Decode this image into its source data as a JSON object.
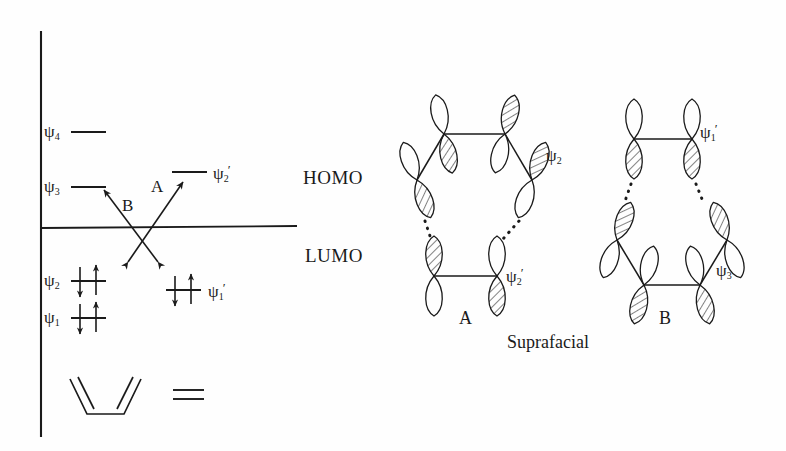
{
  "figure": {
    "caption_bottom": "Suprafacial",
    "ink_color": "#1a1a1a",
    "background_color": "#fefefe"
  },
  "energy_diagram": {
    "axis": {
      "vertical_label": "",
      "zero_line_label": ""
    },
    "diene_levels": [
      {
        "id": "psi4",
        "symbol": "ψ",
        "sub": "4",
        "prime": "",
        "electrons": [],
        "energy_rank": 4
      },
      {
        "id": "psi3",
        "symbol": "ψ",
        "sub": "3",
        "prime": "",
        "electrons": [],
        "energy_rank": 3
      },
      {
        "id": "psi2",
        "symbol": "ψ",
        "sub": "2",
        "prime": "",
        "electrons": [
          "up",
          "down"
        ],
        "energy_rank": 2
      },
      {
        "id": "psi1",
        "symbol": "ψ",
        "sub": "1",
        "prime": "",
        "electrons": [
          "up",
          "down"
        ],
        "energy_rank": 1
      }
    ],
    "dienophile_levels": [
      {
        "id": "psi2prime",
        "symbol": "ψ",
        "sub": "2",
        "prime": "′",
        "electrons": [],
        "energy_rank": 2
      },
      {
        "id": "psi1prime",
        "symbol": "ψ",
        "sub": "1",
        "prime": "′",
        "electrons": [
          "up",
          "down"
        ],
        "energy_rank": 1
      }
    ],
    "interaction_arrows": [
      {
        "id": "arrow-a",
        "label": "A",
        "from": "psi2",
        "to": "psi2prime"
      },
      {
        "id": "arrow-b",
        "label": "B",
        "from": "psi1prime",
        "to": "psi3"
      }
    ],
    "structure": {
      "name": "s-cis-butadiene",
      "equals_sign": "="
    }
  },
  "orbital_panel": {
    "row_labels": [
      {
        "id": "homo",
        "text": "HOMO"
      },
      {
        "id": "lumo",
        "text": "LUMO"
      }
    ],
    "interactions": [
      {
        "id": "interaction-a",
        "caption": "A",
        "homo": {
          "symbol": "ψ",
          "sub": "2",
          "prime": "",
          "molecule": "diene",
          "lobes": 4
        },
        "lumo": {
          "symbol": "ψ",
          "sub": "2",
          "prime": "′",
          "molecule": "dienophile",
          "lobes": 2
        }
      },
      {
        "id": "interaction-b",
        "caption": "B",
        "homo": {
          "symbol": "ψ",
          "sub": "1",
          "prime": "′",
          "molecule": "dienophile",
          "lobes": 2
        },
        "lumo": {
          "symbol": "ψ",
          "sub": "3",
          "prime": "",
          "molecule": "diene",
          "lobes": 4
        }
      }
    ]
  }
}
